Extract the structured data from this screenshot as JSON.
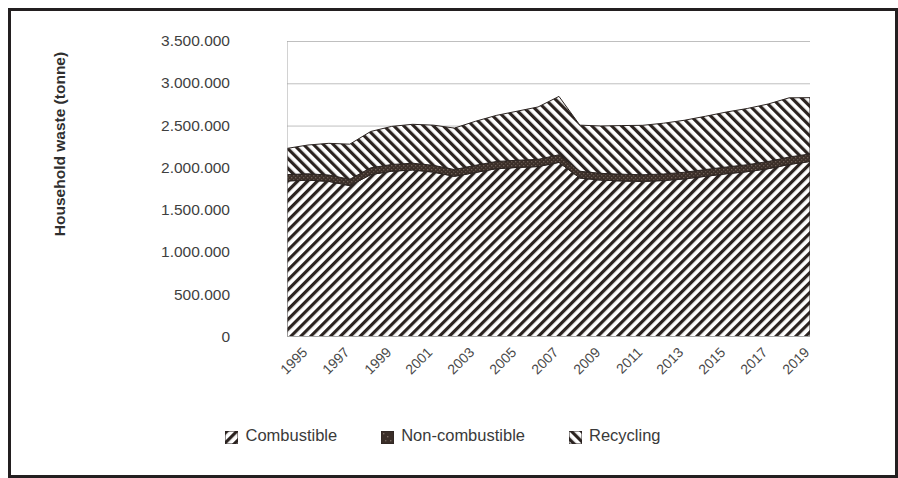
{
  "chart_data": {
    "type": "area",
    "title": "",
    "subtitle": "",
    "xlabel": "",
    "ylabel": "Household waste (tonne)",
    "stacked": true,
    "grid": true,
    "legend_position": "bottom",
    "ylim": [
      0,
      3500000
    ],
    "ytick_step": 500000,
    "ytick_labels": [
      "0",
      "500.000",
      "1.000.000",
      "1.500.000",
      "2.000.000",
      "2.500.000",
      "3.000.000",
      "3.500.000"
    ],
    "ytick_values": [
      0,
      500000,
      1000000,
      1500000,
      2000000,
      2500000,
      3000000,
      3500000
    ],
    "xtick_labels": [
      "1995",
      "1997",
      "1999",
      "2001",
      "2003",
      "2005",
      "2007",
      "2009",
      "2011",
      "2013",
      "2015",
      "2017",
      "2019"
    ],
    "x": [
      1995,
      1996,
      1997,
      1998,
      1999,
      2000,
      2001,
      2002,
      2003,
      2004,
      2005,
      2006,
      2007,
      2008,
      2009,
      2010,
      2011,
      2012,
      2013,
      2014,
      2015,
      2016,
      2017,
      2018,
      2019,
      2020
    ],
    "series": [
      {
        "name": "Combustible",
        "pattern": "forward-diagonal-hatch",
        "color": "#2b2320",
        "values": [
          1845000,
          1855000,
          1840000,
          1790000,
          1920000,
          1960000,
          1975000,
          1950000,
          1900000,
          1945000,
          1990000,
          2005000,
          2015000,
          2065000,
          1880000,
          1855000,
          1845000,
          1840000,
          1850000,
          1870000,
          1900000,
          1930000,
          1955000,
          1990000,
          2040000,
          2075000
        ]
      },
      {
        "name": "Non-combustible",
        "pattern": "dark-stipple",
        "color": "#3a2e28",
        "values": [
          75000,
          75000,
          75000,
          75000,
          80000,
          80000,
          80000,
          80000,
          80000,
          85000,
          85000,
          85000,
          85000,
          90000,
          80000,
          80000,
          80000,
          78000,
          78000,
          78000,
          80000,
          80000,
          82000,
          85000,
          88000,
          90000
        ]
      },
      {
        "name": "Recycling",
        "pattern": "back-diagonal-hatch",
        "color": "#2b2320",
        "values": [
          310000,
          340000,
          375000,
          415000,
          430000,
          450000,
          460000,
          475000,
          490000,
          520000,
          545000,
          580000,
          620000,
          690000,
          545000,
          560000,
          575000,
          585000,
          600000,
          615000,
          630000,
          650000,
          665000,
          680000,
          700000,
          665000
        ]
      }
    ],
    "totals": [
      2230000,
      2270000,
      2290000,
      2280000,
      2430000,
      2490000,
      2515000,
      2505000,
      2470000,
      2550000,
      2620000,
      2670000,
      2720000,
      2845000,
      2505000,
      2495000,
      2500000,
      2503000,
      2528000,
      2563000,
      2610000,
      2660000,
      2702000,
      2755000,
      2828000,
      2830000
    ]
  },
  "legend": {
    "items": [
      {
        "label": "Combustible",
        "swatch": "hatch-forward-swatch"
      },
      {
        "label": "Non-combustible",
        "swatch": "stipple-swatch"
      },
      {
        "label": "Recycling",
        "swatch": "hatch-back-swatch"
      }
    ]
  },
  "colors": {
    "frame": "#231f20",
    "gridline": "#bfbfbf",
    "axis": "#a6a6a6",
    "text": "#3a3a3a",
    "ink": "#2b2320"
  }
}
